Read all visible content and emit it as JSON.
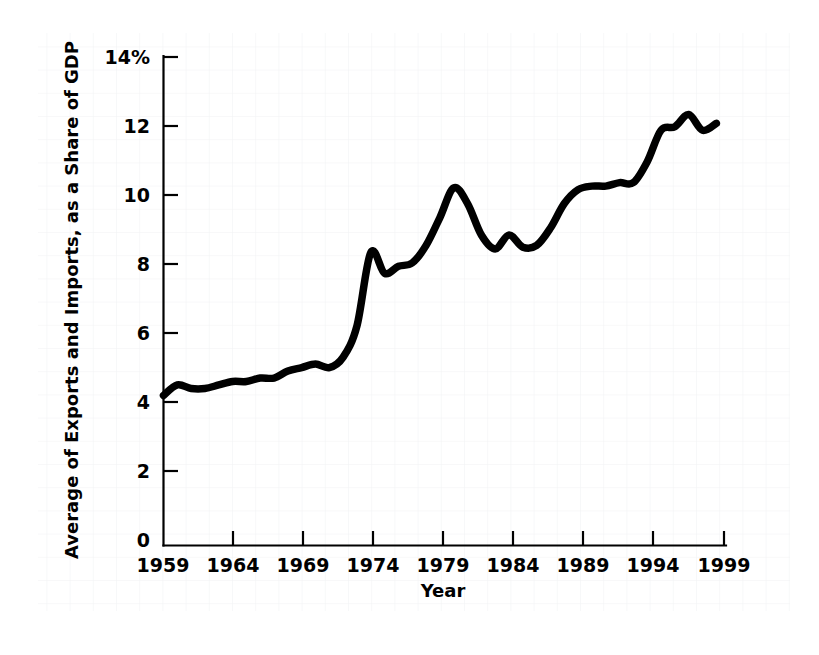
{
  "figure": {
    "background_color": "#ffffff",
    "line_color": "#000000",
    "grid_color": "#f0f1f3",
    "grid_note": "faint scanned graph-paper grid"
  },
  "chart_data": {
    "type": "line",
    "title": "",
    "xlabel": "Year",
    "ylabel": "Average of Exports and Imports, as a Share of GDP",
    "xlim": [
      1959,
      1999.7
    ],
    "ylim": [
      0,
      14
    ],
    "grid": false,
    "legend": null,
    "y_ticks": [
      0,
      2,
      4,
      6,
      8,
      10,
      12,
      14
    ],
    "y_tick_labels": [
      "0",
      "2",
      "4",
      "6",
      "8",
      "10",
      "12",
      "14%"
    ],
    "x_ticks": [
      1959,
      1964,
      1969,
      1974,
      1979,
      1984,
      1989,
      1994,
      1999
    ],
    "x_tick_labels": [
      "1959",
      "1964",
      "1969",
      "1974",
      "1979",
      "1984",
      "1989",
      "1994",
      "1999"
    ],
    "series": [
      {
        "name": "Average of Exports and Imports as a Share of GDP",
        "x": [
          1959,
          1960,
          1961,
          1962,
          1963,
          1964,
          1965,
          1966,
          1967,
          1968,
          1969,
          1970,
          1971,
          1972,
          1973,
          1974,
          1975,
          1976,
          1977,
          1978,
          1979,
          1980,
          1981,
          1982,
          1983,
          1984,
          1985,
          1986,
          1987,
          1988,
          1989,
          1990,
          1991,
          1992,
          1993,
          1994,
          1995,
          1996,
          1997,
          1998,
          1999
        ],
        "values": [
          4.3,
          4.6,
          4.5,
          4.5,
          4.6,
          4.7,
          4.7,
          4.8,
          4.8,
          5.0,
          5.1,
          5.2,
          5.1,
          5.4,
          6.3,
          8.4,
          7.8,
          8.0,
          8.1,
          8.6,
          9.4,
          10.25,
          9.8,
          8.9,
          8.5,
          8.9,
          8.55,
          8.6,
          9.1,
          9.8,
          10.2,
          10.3,
          10.3,
          10.4,
          10.4,
          11.0,
          11.9,
          12.0,
          12.35,
          11.9,
          12.1
        ]
      }
    ]
  },
  "axes": {
    "y_unit_suffix": "%",
    "x_axis_title": "Year",
    "y_axis_title": "Average of Exports and Imports, as a Share of GDP"
  }
}
